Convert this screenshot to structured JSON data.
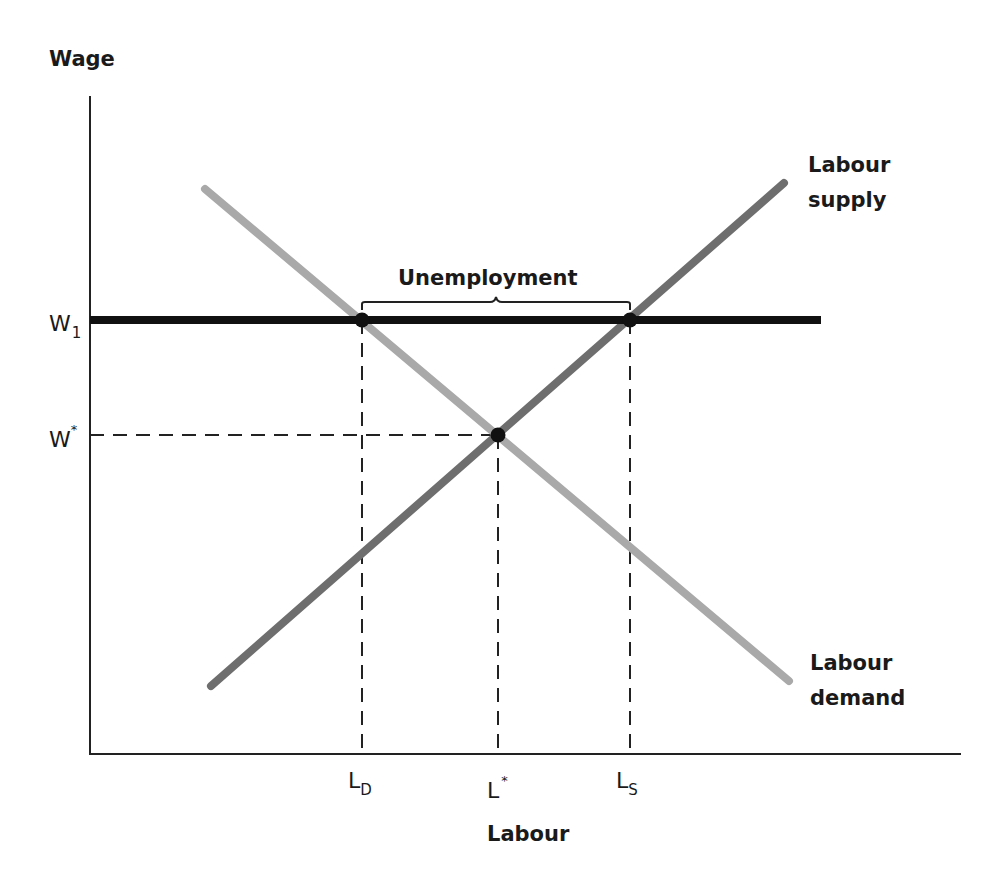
{
  "diagram": {
    "y_axis_label": "Wage",
    "x_axis_label": "Labour",
    "wage_levels": {
      "w1": {
        "base": "W",
        "sub": "1"
      },
      "wstar": {
        "base": "W",
        "sup": "*"
      }
    },
    "labour_levels": {
      "ld": {
        "base": "L",
        "sub": "D"
      },
      "lstar": {
        "base": "L",
        "sup": "*"
      },
      "ls": {
        "base": "L",
        "sub": "S"
      }
    },
    "curves": {
      "supply": {
        "line1": "Labour",
        "line2": "supply",
        "color": "#6e6e6e"
      },
      "demand": {
        "line1": "Labour",
        "line2": "demand",
        "color": "#a9a9a9"
      },
      "wage_floor": {
        "color": "#111111"
      }
    },
    "bracket_label": "Unemployment",
    "points": [
      {
        "name": "demand-at-w1",
        "x_label": "LD",
        "y_label": "W1"
      },
      {
        "name": "equilibrium",
        "x_label": "L*",
        "y_label": "W*"
      },
      {
        "name": "supply-at-w1",
        "x_label": "LS",
        "y_label": "W1"
      }
    ]
  }
}
